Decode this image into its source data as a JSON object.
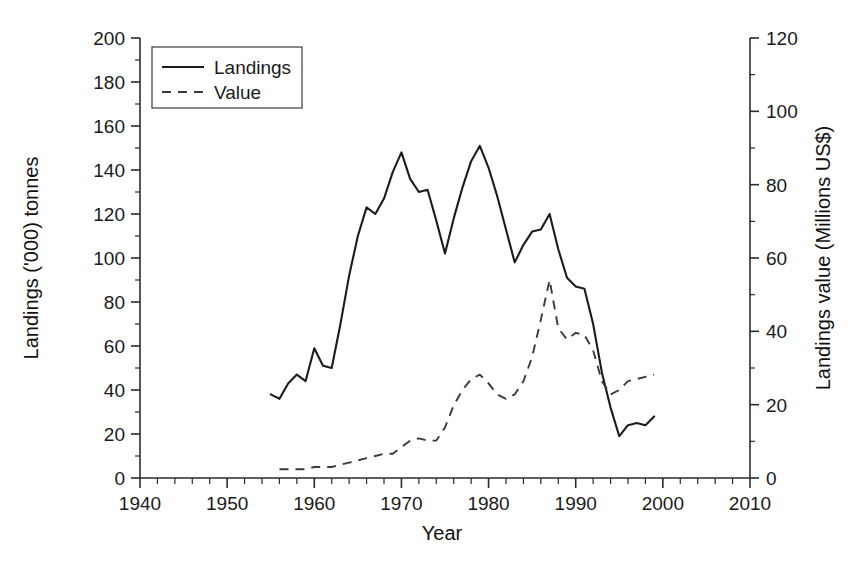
{
  "chart_data": {
    "type": "line",
    "title": "",
    "xlabel": "Year",
    "ylabel": "Landings ('000) tonnes",
    "y2label": "Landings value (Millions US$)",
    "xlim": [
      1940,
      2010
    ],
    "ylim": [
      0,
      200
    ],
    "y2lim": [
      0,
      120
    ],
    "grid": false,
    "legend_position": "top-left",
    "x_ticks": [
      1940,
      1950,
      1960,
      1970,
      1980,
      1990,
      2000,
      2010
    ],
    "x_tick_labels": [
      "1940",
      "1950",
      "1960",
      "1970",
      "1980",
      "1990",
      "2000",
      "2010"
    ],
    "x_minor_tick_step": 2,
    "y_ticks": [
      0,
      20,
      40,
      60,
      80,
      100,
      120,
      140,
      160,
      180,
      200
    ],
    "y_tick_labels": [
      "0",
      "20",
      "40",
      "60",
      "80",
      "100",
      "120",
      "140",
      "160",
      "180",
      "200"
    ],
    "y2_ticks": [
      0,
      20,
      40,
      60,
      80,
      100,
      120
    ],
    "y2_tick_labels": [
      "0",
      "20",
      "40",
      "60",
      "80",
      "100",
      "120"
    ],
    "y2_minor_tick_step": 10,
    "series": [
      {
        "name": "Landings",
        "axis": "left",
        "style": "solid",
        "color": "#1c1c1c",
        "x": [
          1955,
          1956,
          1957,
          1958,
          1959,
          1960,
          1961,
          1962,
          1963,
          1964,
          1965,
          1966,
          1967,
          1968,
          1969,
          1970,
          1971,
          1972,
          1973,
          1974,
          1975,
          1976,
          1977,
          1978,
          1979,
          1980,
          1981,
          1982,
          1983,
          1984,
          1985,
          1986,
          1987,
          1988,
          1989,
          1990,
          1991,
          1992,
          1993,
          1994,
          1995,
          1996,
          1997,
          1998,
          1999
        ],
        "y": [
          38,
          36,
          43,
          47,
          44,
          59,
          51,
          50,
          70,
          92,
          110,
          123,
          120,
          127,
          139,
          148,
          136,
          130,
          131,
          117,
          102,
          118,
          132,
          144,
          151,
          141,
          128,
          113,
          98,
          106,
          112,
          113,
          120,
          104,
          91,
          87,
          86,
          70,
          48,
          32,
          19,
          24,
          25,
          24,
          28
        ]
      },
      {
        "name": "Value",
        "axis": "right",
        "style": "dashed",
        "color": "#3a3a3a",
        "x": [
          1956,
          1957,
          1958,
          1959,
          1960,
          1961,
          1962,
          1963,
          1964,
          1965,
          1966,
          1967,
          1968,
          1969,
          1970,
          1971,
          1972,
          1973,
          1974,
          1975,
          1976,
          1977,
          1978,
          1979,
          1980,
          1981,
          1982,
          1983,
          1984,
          1985,
          1986,
          1987,
          1988,
          1989,
          1990,
          1991,
          1992,
          1993,
          1994,
          1995,
          1996,
          1997,
          1998,
          1999
        ],
        "y_left_scale": [
          4,
          4,
          4,
          4,
          5,
          5,
          5,
          6,
          7,
          8,
          9,
          10,
          11,
          11,
          14,
          17,
          18,
          17,
          17,
          23,
          33,
          40,
          45,
          47,
          43,
          38,
          36,
          38,
          44,
          55,
          72,
          90,
          68,
          63,
          66,
          65,
          58,
          44,
          38,
          40,
          44,
          45,
          46,
          47
        ],
        "y": [
          2.4,
          2.4,
          2.4,
          2.4,
          3.0,
          3.0,
          3.0,
          3.6,
          4.2,
          4.8,
          5.4,
          6.0,
          6.6,
          6.6,
          8.4,
          10.2,
          10.8,
          10.2,
          10.2,
          13.8,
          19.8,
          24.0,
          27.0,
          28.2,
          25.8,
          22.8,
          21.6,
          22.8,
          26.4,
          33.0,
          43.2,
          54.0,
          40.8,
          37.8,
          39.6,
          39.0,
          34.8,
          26.4,
          22.8,
          24.0,
          26.4,
          27.0,
          27.6,
          28.2
        ]
      }
    ]
  },
  "legend": {
    "entries": [
      {
        "label": "Landings",
        "style": "solid"
      },
      {
        "label": "Value",
        "style": "dashed"
      }
    ]
  }
}
